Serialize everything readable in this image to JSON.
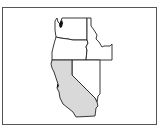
{
  "map": {
    "title": "Western United States locator map",
    "highlight_color": "#d9d9d9",
    "outline_color": "#222222",
    "frame_color": "#555555",
    "states": [
      {
        "id": "washington",
        "name": "Washington",
        "highlighted": false
      },
      {
        "id": "oregon",
        "name": "Oregon",
        "highlighted": false
      },
      {
        "id": "idaho",
        "name": "Idaho",
        "highlighted": false
      },
      {
        "id": "nevada",
        "name": "Nevada",
        "highlighted": false
      },
      {
        "id": "california",
        "name": "California",
        "highlighted": true
      }
    ],
    "highlighted_state": "California"
  }
}
